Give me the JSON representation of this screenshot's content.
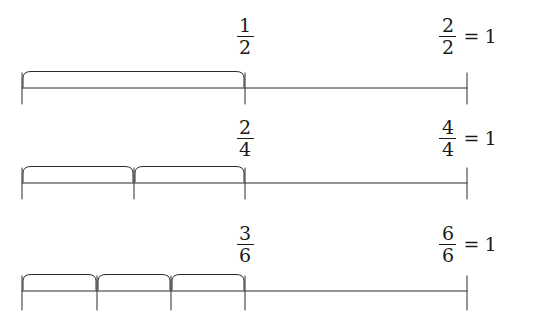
{
  "figure": {
    "stroke_color": "#2b2b2b",
    "background_color": "#ffffff",
    "axis": {
      "start_x": 22,
      "end_x": 467,
      "mid_x": 245
    }
  },
  "rows": [
    {
      "id": "halves",
      "denominator": 2,
      "midpoint_label": {
        "numerator": "1",
        "denominator": "2"
      },
      "end_label": {
        "numerator": "2",
        "denominator": "2",
        "equals": "=",
        "whole": "1"
      },
      "brace_count": 1,
      "tick_positions": [
        22,
        245,
        467
      ],
      "brace_ticks": [
        22,
        245
      ]
    },
    {
      "id": "fourths",
      "denominator": 4,
      "midpoint_label": {
        "numerator": "2",
        "denominator": "4"
      },
      "end_label": {
        "numerator": "4",
        "denominator": "4",
        "equals": "=",
        "whole": "1"
      },
      "brace_count": 2,
      "tick_positions": [
        22,
        134,
        245,
        467
      ],
      "brace_ticks": [
        22,
        134,
        245
      ]
    },
    {
      "id": "sixths",
      "denominator": 6,
      "midpoint_label": {
        "numerator": "3",
        "denominator": "6"
      },
      "end_label": {
        "numerator": "6",
        "denominator": "6",
        "equals": "=",
        "whole": "1"
      },
      "brace_count": 3,
      "tick_positions": [
        22,
        97,
        171,
        245,
        467
      ],
      "brace_ticks": [
        22,
        97,
        171,
        245
      ]
    }
  ]
}
